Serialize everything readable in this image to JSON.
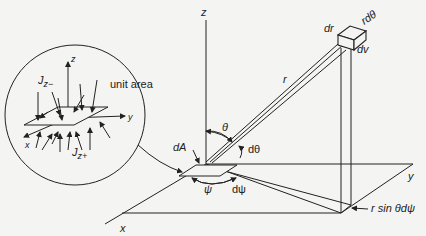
{
  "diagram": {
    "type": "spherical-coordinate radiation geometry",
    "axes": {
      "z": "z",
      "x": "x",
      "y": "y"
    },
    "main_labels": {
      "dA": "dA",
      "theta": "θ",
      "dtheta": "dθ",
      "psi": "ψ",
      "dpsi": "dψ",
      "r": "r",
      "dr": "dr",
      "rdtheta": "rdθ",
      "dv": "dv",
      "rsinthetadpsi": "r sin θdψ"
    },
    "inset": {
      "title": "unit area",
      "axes": {
        "z": "z",
        "x": "x",
        "y": "y"
      },
      "flux_minus": "J",
      "flux_minus_sub": "z−",
      "flux_plus": "J",
      "flux_plus_sub": "z+"
    },
    "colors": {
      "line": "#222222",
      "background": "#f4f4f2"
    }
  }
}
